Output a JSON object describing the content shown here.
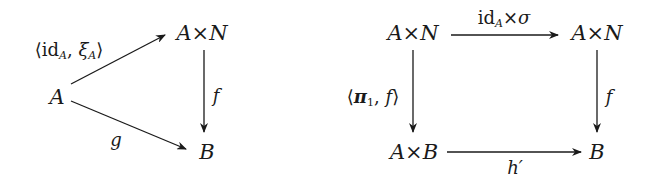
{
  "diagrams": [
    {
      "name": "triangle",
      "nodes": {
        "A": "A",
        "AxN": "A×N",
        "B": "B"
      },
      "arrows": [
        {
          "from": "A",
          "to": "A×N",
          "label": "⟨idA, ξA⟩",
          "label_parts": {
            "open": "⟨",
            "id": "id",
            "id_sub": "A",
            "sep": ", ",
            "xi": "ξ",
            "xi_sub": "A",
            "close": "⟩"
          }
        },
        {
          "from": "A×N",
          "to": "B",
          "label": "f"
        },
        {
          "from": "A",
          "to": "B",
          "label": "g"
        }
      ]
    },
    {
      "name": "square",
      "nodes": {
        "top_left": "A×N",
        "top_right": "A×N",
        "bottom_left": "A×B",
        "bottom_right": "B"
      },
      "arrows": [
        {
          "from": "A×N",
          "to": "A×N",
          "label": "idA×σ",
          "label_parts": {
            "id": "id",
            "id_sub": "A",
            "times": "×",
            "sigma": "σ"
          }
        },
        {
          "from": "A×N",
          "to": "A×B",
          "label": "⟨π1, f⟩",
          "label_parts": {
            "open": "⟨",
            "pi": "π",
            "pi_sub": "1",
            "sep": ", ",
            "f": "f",
            "close": "⟩"
          }
        },
        {
          "from": "A×N",
          "to": "B",
          "label": "f"
        },
        {
          "from": "A×B",
          "to": "B",
          "label": "h′"
        }
      ]
    }
  ],
  "colors": {
    "ink": "#1a1a1a",
    "background": "#ffffff"
  }
}
